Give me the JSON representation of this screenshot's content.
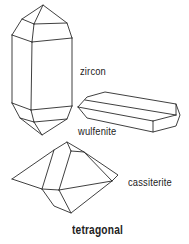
{
  "diagram": {
    "title": "tetragonal",
    "crystals": [
      {
        "name": "zircon",
        "label": "zircon"
      },
      {
        "name": "wulfenite",
        "label": "wulfenite"
      },
      {
        "name": "cassiterite",
        "label": "cassiterite"
      }
    ],
    "colors": {
      "line": "#2a2a2a",
      "text": "#222222",
      "background": "#ffffff"
    }
  }
}
